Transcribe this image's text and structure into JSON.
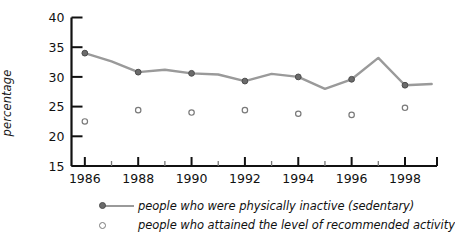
{
  "chart_data": {
    "type": "line",
    "title": "",
    "xlabel": "",
    "ylabel": "percentage",
    "xlim": [
      1985.5,
      1999.2
    ],
    "ylim": [
      15,
      40
    ],
    "grid": false,
    "legend_position": "bottom",
    "y_ticks": [
      15,
      20,
      25,
      30,
      35,
      40
    ],
    "x_ticks_major": [
      1986,
      1988,
      1990,
      1992,
      1994,
      1996,
      1998
    ],
    "x_ticks_minor": [
      1987,
      1989,
      1991,
      1993,
      1995,
      1997
    ],
    "x_tick_labels": [
      "1986",
      "1988",
      "1990",
      "1992",
      "1994",
      "1996",
      "1998"
    ],
    "y_tick_labels": [
      "15",
      "20",
      "25",
      "30",
      "35",
      "40"
    ],
    "series": [
      {
        "name": "people who were physically inactive (sedentary)",
        "style": "line-with-markers",
        "color": "#9a9a9a",
        "marker_color": "#6b6b6b",
        "x": [
          1986,
          1987,
          1988,
          1989,
          1990,
          1991,
          1992,
          1993,
          1994,
          1995,
          1996,
          1997,
          1998,
          1999
        ],
        "values": [
          34.0,
          32.6,
          30.8,
          31.2,
          30.6,
          30.4,
          29.3,
          30.5,
          30.0,
          28.0,
          29.6,
          33.2,
          28.6,
          28.8
        ],
        "marker_x": [
          1986,
          1988,
          1990,
          1992,
          1994,
          1996,
          1998
        ],
        "marker_values": [
          34.0,
          30.8,
          30.6,
          29.3,
          30.0,
          29.6,
          28.6
        ]
      },
      {
        "name": "people who attained the level of recommended activity",
        "style": "open-circles",
        "color": "#7a7a7a",
        "x": [
          1986,
          1988,
          1990,
          1992,
          1994,
          1996,
          1998
        ],
        "values": [
          22.5,
          24.4,
          24.0,
          24.4,
          23.8,
          23.6,
          24.8
        ]
      }
    ]
  },
  "legend": {
    "rows": [
      {
        "label": "people who were physically inactive (sedentary)",
        "marker": "line-dot-marker"
      },
      {
        "label": "people who attained the level of recommended activity",
        "marker": "open-circle-marker"
      }
    ]
  },
  "axes": {
    "y_title": "percentage"
  }
}
